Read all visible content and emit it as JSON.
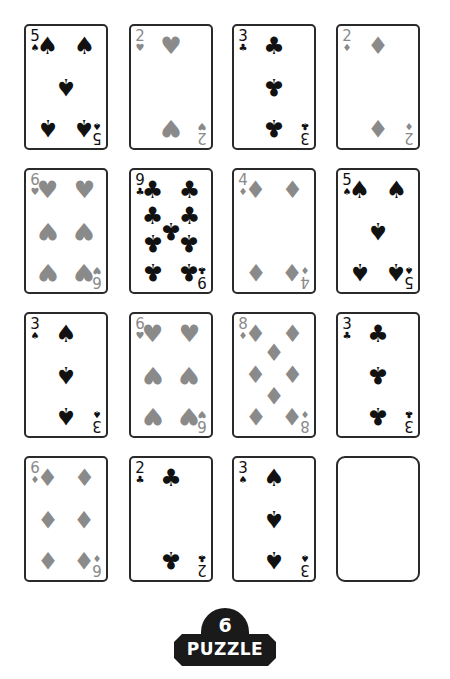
{
  "suits": {
    "spades": "♠",
    "hearts": "♥",
    "diamonds": "♦",
    "clubs": "♣"
  },
  "colors": {
    "red_suit": "#8a8a8a",
    "black_suit": "#111111",
    "card_border": "#2a2a2a",
    "badge_bg": "#1a1a1a"
  },
  "cards": [
    {
      "rank": "5",
      "suit": "spades",
      "sym": "♠",
      "color": "black"
    },
    {
      "rank": "2",
      "suit": "hearts",
      "sym": "♥",
      "color": "red"
    },
    {
      "rank": "3",
      "suit": "clubs",
      "sym": "♣",
      "color": "black"
    },
    {
      "rank": "2",
      "suit": "diamonds",
      "sym": "♦",
      "color": "red"
    },
    {
      "rank": "6",
      "suit": "hearts",
      "sym": "♥",
      "color": "red"
    },
    {
      "rank": "9",
      "suit": "clubs",
      "sym": "♣",
      "color": "black"
    },
    {
      "rank": "4",
      "suit": "diamonds",
      "sym": "♦",
      "color": "red"
    },
    {
      "rank": "5",
      "suit": "spades",
      "sym": "♠",
      "color": "black"
    },
    {
      "rank": "3",
      "suit": "spades",
      "sym": "♠",
      "color": "black"
    },
    {
      "rank": "6",
      "suit": "hearts",
      "sym": "♥",
      "color": "red"
    },
    {
      "rank": "8",
      "suit": "diamonds",
      "sym": "♦",
      "color": "red"
    },
    {
      "rank": "3",
      "suit": "clubs",
      "sym": "♣",
      "color": "black"
    },
    {
      "rank": "6",
      "suit": "diamonds",
      "sym": "♦",
      "color": "red"
    },
    {
      "rank": "2",
      "suit": "clubs",
      "sym": "♣",
      "color": "black"
    },
    {
      "rank": "3",
      "suit": "spades",
      "sym": "♠",
      "color": "black"
    },
    {
      "rank": "",
      "suit": "",
      "sym": "",
      "color": "empty"
    }
  ],
  "puzzle": {
    "number": "6",
    "label": "PUZZLE"
  }
}
